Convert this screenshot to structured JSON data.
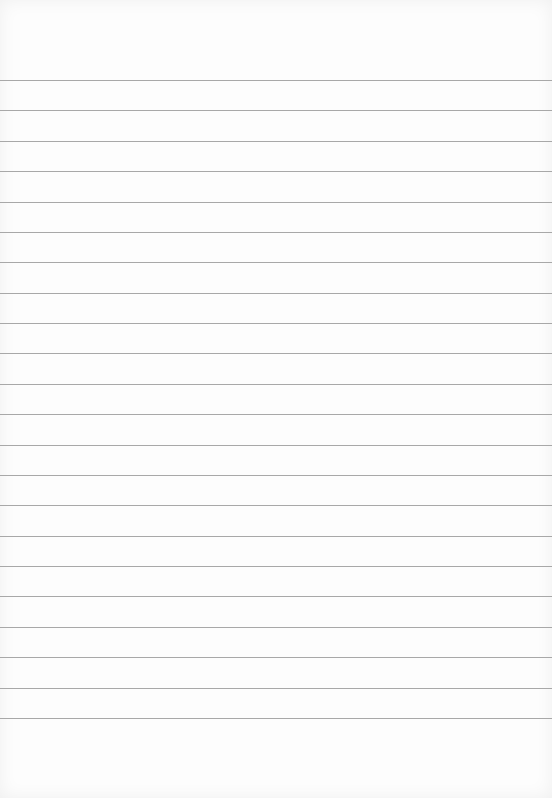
{
  "document": {
    "type": "lined paper",
    "line_count": 22,
    "line_color": "#a8a8a8",
    "paper_color": "#fdfdfd",
    "text": ""
  }
}
